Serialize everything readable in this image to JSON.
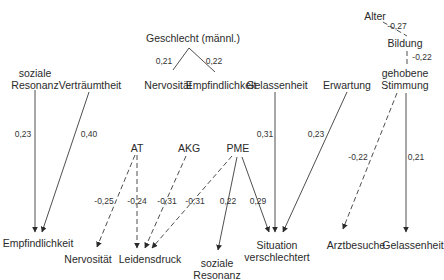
{
  "diagram": {
    "title": "",
    "nodes": {
      "geschlecht": "Geschlecht (männl.)",
      "alter": "Alter",
      "bildung": "Bildung",
      "gehobene_stimmung_1": "gehobene",
      "gehobene_stimmung_2": "Stimmung",
      "soziale_resonanz_top_1": "soziale",
      "soziale_resonanz_top_2": "Resonanz",
      "vertraeumtheit": "Verträumtheit",
      "nervositaet_top": "Nervosität",
      "empfindlichkeit_top": "Empfindlichkeit",
      "gelassenheit_top": "Gelassenheit",
      "erwartung": "Erwartung",
      "at": "AT",
      "akg": "AKG",
      "pme": "PME",
      "empfindlichkeit_bottom": "Empfindlichkeit",
      "nervositaet_bottom": "Nervosität",
      "leidensdruck": "Leidensdruck",
      "soziale_resonanz_bottom_1": "soziale",
      "soziale_resonanz_bottom_2": "Resonanz",
      "situation_1": "Situation",
      "situation_2": "verschlechtert",
      "arztbesuche": "Arztbesuche",
      "gelassenheit_bottom": "Gelassenheit"
    },
    "edges": [
      {
        "from": "Geschlecht (männl.)",
        "to": "Nervosität",
        "coef": "0,21",
        "style": "solid"
      },
      {
        "from": "Geschlecht (männl.)",
        "to": "Empfindlichkeit",
        "coef": "0,22",
        "style": "solid"
      },
      {
        "from": "Alter",
        "to": "Bildung",
        "coef": "-0,27",
        "style": "dashed"
      },
      {
        "from": "Bildung",
        "to": "gehobene Stimmung",
        "coef": "-0,22",
        "style": "dashed"
      },
      {
        "from": "soziale Resonanz",
        "to": "Empfindlichkeit",
        "coef": "0,23",
        "style": "solid"
      },
      {
        "from": "Verträumtheit",
        "to": "Empfindlichkeit",
        "coef": "0,40",
        "style": "solid"
      },
      {
        "from": "Gelassenheit",
        "to": "Situation verschlechtert",
        "coef": "0,31",
        "style": "solid"
      },
      {
        "from": "Erwartung",
        "to": "Situation verschlechtert",
        "coef": "0,23",
        "style": "solid"
      },
      {
        "from": "gehobene Stimmung",
        "to": "Arztbesuche",
        "coef": "-0,22",
        "style": "dashed"
      },
      {
        "from": "gehobene Stimmung",
        "to": "Gelassenheit",
        "coef": "0,21",
        "style": "solid"
      },
      {
        "from": "AT",
        "to": "Nervosität",
        "coef": "-0,25",
        "style": "dashed"
      },
      {
        "from": "AT",
        "to": "Leidensdruck",
        "coef": "-0,24",
        "style": "dashed"
      },
      {
        "from": "AKG",
        "to": "Leidensdruck",
        "coef": "-0,31",
        "style": "dashed"
      },
      {
        "from": "PME",
        "to": "Leidensdruck",
        "coef": "-0,31",
        "style": "dashed"
      },
      {
        "from": "PME",
        "to": "soziale Resonanz",
        "coef": "0,22",
        "style": "solid"
      },
      {
        "from": "PME",
        "to": "Situation verschlechtert",
        "coef": "0,29",
        "style": "solid"
      }
    ],
    "colors": {
      "line": "#3a3a3a",
      "text": "#2a2a2a",
      "background": "#ffffff"
    }
  }
}
